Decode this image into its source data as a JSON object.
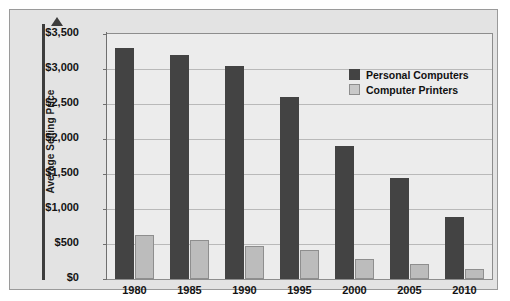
{
  "chart_data": {
    "type": "bar",
    "title": "",
    "subtitle": "",
    "xlabel": "",
    "ylabel": "Average Selling Price",
    "categories": [
      "1980",
      "1985",
      "1990",
      "1995",
      "2000",
      "2005",
      "2010"
    ],
    "series": [
      {
        "name": "Personal Computers",
        "color": "#434343",
        "values": [
          3300,
          3200,
          3050,
          2600,
          1900,
          1450,
          880
        ]
      },
      {
        "name": "Computer Printers",
        "color": "#bcbcbc",
        "values": [
          625,
          560,
          470,
          410,
          280,
          215,
          145
        ]
      }
    ],
    "ylim": [
      0,
      3500
    ],
    "ytick_values": [
      0,
      500,
      1000,
      1500,
      2000,
      2500,
      3000,
      3500
    ],
    "ytick_labels": [
      "$0",
      "$500",
      "$1,000",
      "$1,500",
      "$2,000",
      "$2,500",
      "$3,000",
      "$3,500"
    ],
    "grid": true,
    "legend_position": "top-right",
    "value_prefix": "$"
  },
  "axes": {
    "y_title": "Average Selling Price",
    "y_arrow": "up-arrow-icon"
  },
  "legend": {
    "items": [
      {
        "label": "Personal Computers",
        "swatch": "#434343"
      },
      {
        "label": "Computer Printers",
        "swatch": "#c9c9c9"
      }
    ]
  },
  "colors": {
    "page_background": "#ffffff",
    "panel_background": "#e3e3e3",
    "plot_background": "#ececec",
    "gridline": "#b9b9b9",
    "axis": "#6f6f6f",
    "series_pc": "#434343",
    "series_printer": "#bcbcbc",
    "text": "#131313"
  }
}
